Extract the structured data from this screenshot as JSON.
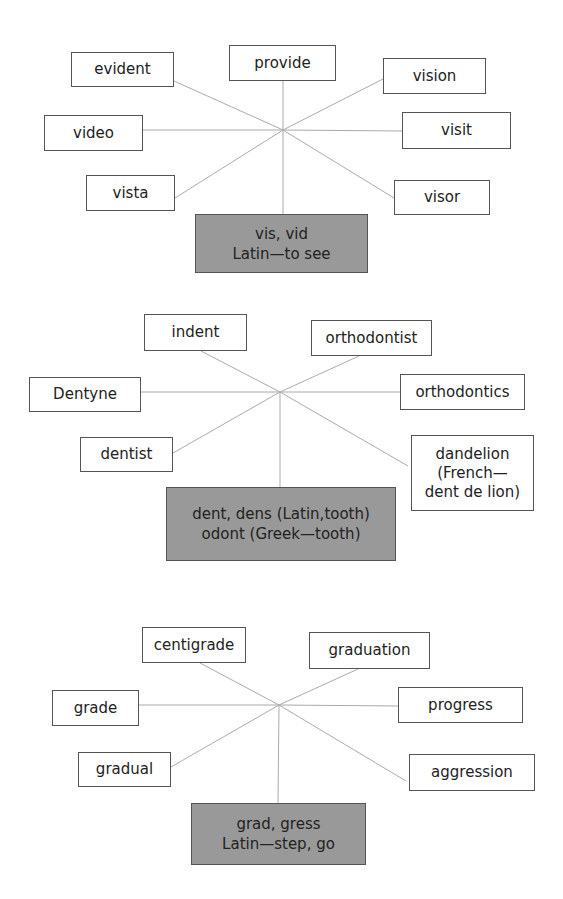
{
  "diagrams": [
    {
      "root": {
        "text": "vis, vid\nLatin—to see",
        "box": [
          195,
          214,
          173,
          59
        ]
      },
      "center": [
        283,
        130
      ],
      "words": [
        {
          "text": "evident",
          "box": [
            71,
            52,
            103,
            35
          ],
          "anchor": [
            174,
            81
          ]
        },
        {
          "text": "provide",
          "box": [
            229,
            45,
            107,
            36
          ],
          "anchor": [
            283,
            81
          ]
        },
        {
          "text": "vision",
          "box": [
            383,
            58,
            103,
            36
          ],
          "anchor": [
            383,
            79
          ]
        },
        {
          "text": "video",
          "box": [
            44,
            115,
            99,
            36
          ],
          "anchor": [
            143,
            130
          ]
        },
        {
          "text": "visit",
          "box": [
            402,
            112,
            109,
            37
          ],
          "anchor": [
            402,
            131
          ]
        },
        {
          "text": "vista",
          "box": [
            86,
            175,
            89,
            36
          ],
          "anchor": [
            175,
            198
          ]
        },
        {
          "text": "visor",
          "box": [
            394,
            180,
            96,
            35
          ],
          "anchor": [
            394,
            198
          ]
        }
      ],
      "stem": [
        283,
        214
      ]
    },
    {
      "root": {
        "text": "dent, dens (Latin,tooth)\nodont (Greek—tooth)",
        "box": [
          166,
          487,
          230,
          74
        ]
      },
      "center": [
        280,
        392
      ],
      "words": [
        {
          "text": "indent",
          "box": [
            144,
            314,
            103,
            37
          ],
          "anchor": [
            201,
            351
          ]
        },
        {
          "text": "orthodontist",
          "box": [
            311,
            320,
            121,
            36
          ],
          "anchor": [
            359,
            356
          ]
        },
        {
          "text": "Dentyne",
          "box": [
            29,
            377,
            112,
            35
          ],
          "anchor": [
            141,
            392
          ]
        },
        {
          "text": "orthodontics",
          "box": [
            400,
            374,
            125,
            36
          ],
          "anchor": [
            400,
            392
          ]
        },
        {
          "text": "dentist",
          "box": [
            80,
            437,
            93,
            35
          ],
          "anchor": [
            173,
            453
          ]
        },
        {
          "text": "dandelion\n(French—\ndent de lion)",
          "box": [
            411,
            435,
            123,
            76
          ],
          "anchor": [
            408,
            466
          ]
        }
      ],
      "stem": [
        280,
        487
      ]
    },
    {
      "root": {
        "text": "grad, gress\nLatin—step, go",
        "box": [
          191,
          803,
          175,
          62
        ]
      },
      "center": [
        279,
        705
      ],
      "words": [
        {
          "text": "centigrade",
          "box": [
            142,
            627,
            104,
            36
          ],
          "anchor": [
            200,
            663
          ]
        },
        {
          "text": "graduation",
          "box": [
            309,
            632,
            121,
            37
          ],
          "anchor": [
            358,
            669
          ]
        },
        {
          "text": "grade",
          "box": [
            52,
            690,
            87,
            36
          ],
          "anchor": [
            139,
            705
          ]
        },
        {
          "text": "progress",
          "box": [
            398,
            687,
            125,
            36
          ],
          "anchor": [
            398,
            706
          ]
        },
        {
          "text": "gradual",
          "box": [
            78,
            752,
            93,
            35
          ],
          "anchor": [
            171,
            767
          ]
        },
        {
          "text": "aggression",
          "box": [
            409,
            754,
            126,
            37
          ],
          "anchor": [
            406,
            781
          ]
        }
      ],
      "stem": [
        278,
        803
      ]
    }
  ],
  "colors": {
    "line": "#aaaaaa",
    "border": "#555555",
    "root_fill": "#999999",
    "text": "#222222"
  }
}
